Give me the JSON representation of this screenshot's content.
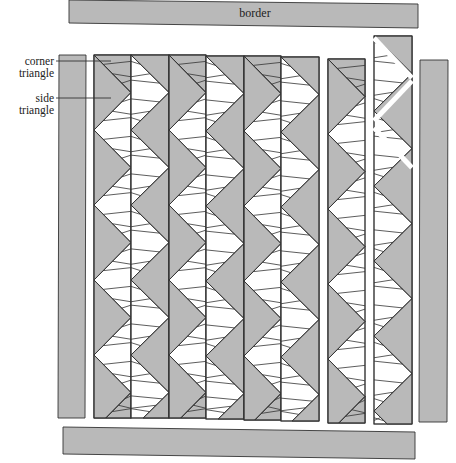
{
  "diagram": {
    "colors": {
      "fabric_gray": "#b9b9b9",
      "background": "#ffffff",
      "line": "#333333"
    },
    "labels": {
      "border": "border",
      "corner_triangle": [
        "corner",
        "triangle"
      ],
      "side_triangle": [
        "side",
        "triangle"
      ]
    },
    "top_border": {
      "x1": 69,
      "y1": 0,
      "x2": 418,
      "y2": 28,
      "label_key": "border"
    },
    "bottom_border": {
      "x": 63,
      "y": 427,
      "w": 352,
      "h": 28
    },
    "left_border": {
      "x": 59,
      "y": 55,
      "w": 27,
      "h": 363
    },
    "right_border": {
      "x": 420,
      "y": 60,
      "w": 28,
      "h": 362
    },
    "zigzag_columns": [
      {
        "x": 94,
        "w": 37,
        "y": 55,
        "h": 363,
        "gray_side": "left"
      },
      {
        "x": 131,
        "w": 38,
        "y": 55,
        "h": 363,
        "gray_side": "right"
      },
      {
        "x": 169,
        "w": 37,
        "y": 55,
        "h": 363,
        "gray_side": "left"
      },
      {
        "x": 206,
        "w": 38,
        "y": 56,
        "h": 363,
        "gray_side": "right"
      },
      {
        "x": 244,
        "w": 37,
        "y": 56,
        "h": 364,
        "gray_side": "left"
      },
      {
        "x": 281,
        "w": 38,
        "y": 57,
        "h": 364,
        "gray_side": "right"
      },
      {
        "x": 328,
        "w": 37,
        "y": 59,
        "h": 364,
        "gray_side": "left"
      },
      {
        "x": 374,
        "w": 38,
        "y": 36,
        "h": 388,
        "gray_side": "right",
        "exploded_top": true
      }
    ],
    "zigzag": {
      "half_period": 37.5,
      "stripes_per_goose": 3
    }
  }
}
